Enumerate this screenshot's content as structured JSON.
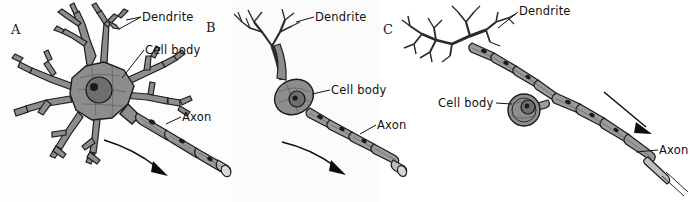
{
  "figure": {
    "background_color": "#ffffff",
    "ink_color": "#1a1a1a",
    "soma_fill": "#8d8d8d",
    "myelin_fill": "#9b9b9b",
    "label_color": "#111111"
  },
  "panels": [
    {
      "letter": "A",
      "name": "multipolar-neuron",
      "labels": {
        "dendrite": "Dendrite",
        "cell_body": "Cell body",
        "axon": "Axon"
      },
      "arrow": "conduction-direction-arrow"
    },
    {
      "letter": "B",
      "name": "bipolar-neuron",
      "labels": {
        "dendrite": "Dendrite",
        "cell_body": "Cell body",
        "axon": "Axon"
      },
      "arrow": "conduction-direction-arrow"
    },
    {
      "letter": "C",
      "name": "unipolar-neuron",
      "labels": {
        "dendrite": "Dendrite",
        "cell_body": "Cell body",
        "axon": "Axon"
      },
      "arrow": "conduction-direction-arrow"
    }
  ]
}
